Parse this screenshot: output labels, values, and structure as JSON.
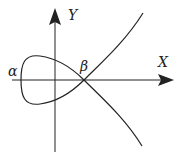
{
  "diagram": {
    "axes": {
      "x_label": "X",
      "y_label": "Y"
    },
    "points": [
      {
        "label": "α",
        "description": "leftmost point of loop on X axis"
      },
      {
        "label": "β",
        "description": "node (self-intersection) on X axis"
      }
    ],
    "colors": {
      "stroke": "#222222",
      "background": "#ffffff"
    }
  }
}
